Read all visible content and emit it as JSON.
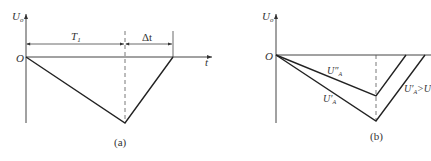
{
  "panel_a": {
    "y_axis_label": "U",
    "y_axis_sub": "o",
    "origin_label": "O",
    "x_axis_label": "t",
    "interval1_label": "T",
    "interval1_sub": "1",
    "interval2_label": "Δt",
    "caption": "(a)"
  },
  "panel_b": {
    "y_axis_label": "U",
    "y_axis_sub": "o",
    "origin_label": "O",
    "curve_upper_label": "U″",
    "curve_upper_sub": "A",
    "curve_lower_label": "U′",
    "curve_lower_sub": "A",
    "curve_lower_right_label": "U′",
    "curve_lower_right_sub": "A",
    "curve_lower_right_suffix": ">U",
    "caption": "(b)"
  }
}
